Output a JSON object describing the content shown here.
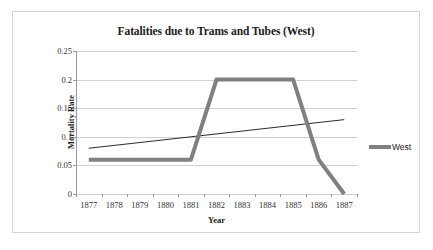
{
  "chart_data": {
    "type": "line",
    "title": "Fatalities due to Trams and Tubes (West)",
    "xlabel": "Year",
    "ylabel": "Mortality Rate",
    "categories": [
      "1877",
      "1878",
      "1879",
      "1880",
      "1881",
      "1882",
      "1883",
      "1884",
      "1885",
      "1886",
      "1887"
    ],
    "x": [
      1877,
      1878,
      1879,
      1880,
      1881,
      1882,
      1883,
      1884,
      1885,
      1886,
      1887
    ],
    "ylim": [
      0,
      0.25
    ],
    "yticks": [
      "0",
      "0.05",
      "0.1",
      "0.15",
      "0.2",
      "0.25"
    ],
    "ytick_values": [
      0,
      0.05,
      0.1,
      0.15,
      0.2,
      0.25
    ],
    "grid": "horizontal",
    "legend_position": "right",
    "series": [
      {
        "name": "West",
        "color": "#808080",
        "style": "thick-line",
        "values": [
          0.06,
          0.06,
          0.06,
          0.06,
          0.06,
          0.2,
          0.2,
          0.2,
          0.2,
          0.06,
          0.0
        ]
      },
      {
        "name": "trendline",
        "color": "#2b2b2b",
        "style": "thin-line",
        "values": [
          0.08,
          0.085,
          0.09,
          0.095,
          0.1,
          0.105,
          0.11,
          0.115,
          0.12,
          0.125,
          0.13
        ]
      }
    ],
    "legend": [
      {
        "label": "West",
        "color": "#808080"
      }
    ]
  },
  "colors": {
    "series_west": "#808080",
    "trendline": "#2b2b2b",
    "gridline": "#d0d0d0",
    "axis": "#9a9a9a",
    "border": "#d4d4d4",
    "text": "#212121",
    "background": "#ffffff"
  }
}
